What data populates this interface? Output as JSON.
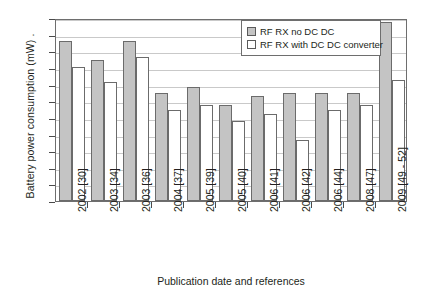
{
  "chart_data": {
    "type": "bar",
    "title": "",
    "xlabel": "Publication date and references",
    "ylabel": "Battery power consumption (mW) .",
    "ylim": [
      0,
      220
    ],
    "ytick_step": 20,
    "grid": true,
    "legend_position": "top-right",
    "categories": [
      "2002 [30]",
      "2003 [34]",
      "2003 [36]",
      "2004 [37]",
      "2005 [39]",
      "2005 [40]",
      "2006 [41]",
      "2006 [42]",
      "2006 [44]",
      "2008 [47]",
      "2009 [49 - 52]"
    ],
    "yticks": [
      "0",
      "20",
      "40",
      "60",
      "80",
      "100",
      "120",
      "140",
      "160",
      "180",
      "200",
      "220"
    ],
    "series": [
      {
        "name": "RF RX no DC DC",
        "color": "#c4c4c4",
        "values": [
          192,
          170,
          192,
          130,
          137,
          115,
          126,
          130,
          130,
          130,
          215
        ]
      },
      {
        "name": "RF RX with DC DC converter",
        "color": "#ffffff",
        "values": [
          161,
          143,
          173,
          109,
          115,
          96,
          105,
          73,
          109,
          116,
          146
        ]
      }
    ]
  },
  "legend": {
    "items": [
      {
        "label": "RF RX no DC DC",
        "swatch": "gray"
      },
      {
        "label": "RF RX with DC DC converter",
        "swatch": "white"
      }
    ]
  }
}
